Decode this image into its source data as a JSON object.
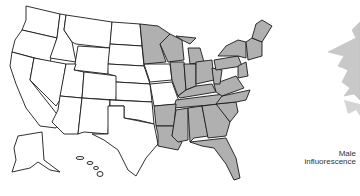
{
  "figure": {
    "type": "species range map",
    "region": "United States (contiguous + Alaska + Hawaii insets)",
    "colors": {
      "range_fill": "#b0b0b0",
      "outside_fill": "#ffffff",
      "border": "#1a1a1a",
      "plant_fill": "#c8c8c8"
    },
    "range_description": "Shaded eastern United States; western boundary through Minnesota, Iowa, Missouri, eastern Oklahoma/Texas, Louisiana",
    "illustration": {
      "caption_line1": "Male",
      "caption_line2": "influorescence"
    }
  }
}
